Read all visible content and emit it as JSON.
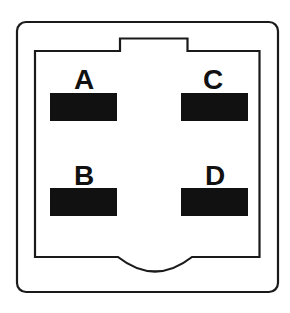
{
  "diagram": {
    "type": "connector-pinout",
    "colors": {
      "outline": "#1a1a1a",
      "pad": "#111111",
      "background": "#ffffff"
    },
    "pins": [
      {
        "id": "A",
        "label": "A",
        "position": "top-left"
      },
      {
        "id": "C",
        "label": "C",
        "position": "top-right"
      },
      {
        "id": "B",
        "label": "B",
        "position": "bottom-left"
      },
      {
        "id": "D",
        "label": "D",
        "position": "bottom-right"
      }
    ]
  }
}
